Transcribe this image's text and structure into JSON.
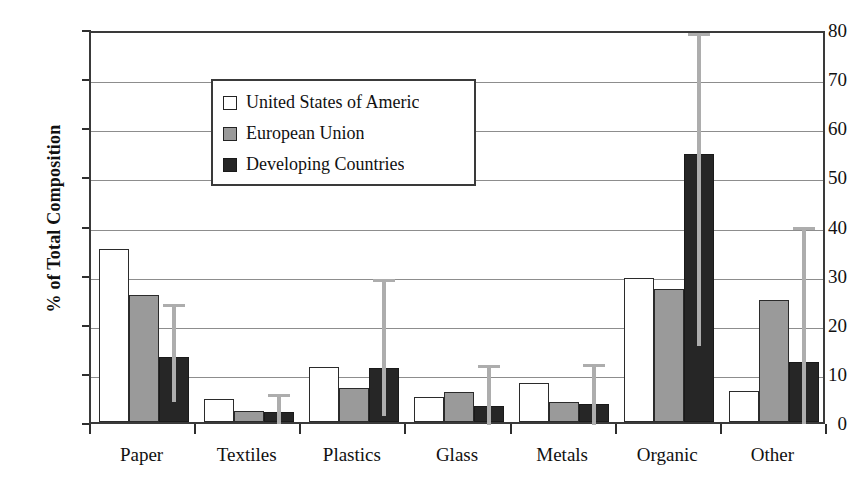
{
  "chart_data": {
    "type": "bar",
    "title": "",
    "xlabel": "",
    "ylabel": "% of Total Composition",
    "ylim": [
      0,
      80
    ],
    "yticks": [
      0,
      10,
      20,
      30,
      40,
      50,
      60,
      70,
      80
    ],
    "grid": true,
    "legend_position": "upper-left-inside",
    "categories": [
      "Paper",
      "Textiles",
      "Plastics",
      "Glass",
      "Metals",
      "Organic",
      "Other"
    ],
    "series": [
      {
        "name": "United States of Americ",
        "color": "#ffffff",
        "values": [
          35.3,
          4.6,
          11.3,
          5.0,
          8.0,
          29.4,
          6.3
        ]
      },
      {
        "name": "European Union",
        "color": "#9a9a9a",
        "values": [
          25.8,
          2.3,
          7.0,
          6.2,
          4.0,
          27.0,
          24.8
        ]
      },
      {
        "name": "Developing Countries",
        "color": "#262626",
        "values": [
          13.3,
          2.0,
          11.0,
          3.3,
          3.6,
          54.6,
          12.3
        ]
      }
    ],
    "error_bars": {
      "series": "Developing Countries",
      "color": "#adadad",
      "ranges": [
        {
          "category": "Paper",
          "low": 4.8,
          "high": 24.8
        },
        {
          "category": "Textiles",
          "low": 0.4,
          "high": 6.5
        },
        {
          "category": "Plastics",
          "low": 2.0,
          "high": 30.0
        },
        {
          "category": "Glass",
          "low": 0.3,
          "high": 12.4
        },
        {
          "category": "Metals",
          "low": 0.3,
          "high": 12.6
        },
        {
          "category": "Organic",
          "low": 16.2,
          "high": 80.0
        },
        {
          "category": "Other",
          "low": 0.4,
          "high": 40.5
        }
      ]
    }
  },
  "legend": {
    "items": [
      {
        "label": "United States of Americ"
      },
      {
        "label": "European Union"
      },
      {
        "label": "Developing Countries"
      }
    ]
  }
}
